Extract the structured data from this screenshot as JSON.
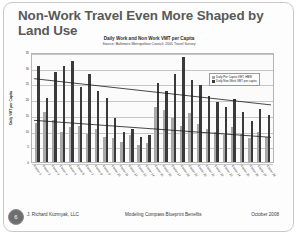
{
  "slide": {
    "title": "Non-Work Travel Even More Shaped by Land Use",
    "page_number": "6"
  },
  "footer": {
    "left": "J. Richard Kuzmyak, LLC",
    "center": "Modeling Compass Blueprint Benefits",
    "right": "October 2008"
  },
  "chart_data": {
    "type": "bar",
    "title": "Daily Work and Non Work VMT per Capita",
    "subtitle": "Source:  Baltimore Metropolitan Council, 2001 Travel Survey",
    "xlabel": "",
    "ylabel": "Daily VMT per Capita",
    "ylim": [
      0,
      35
    ],
    "yticks": [
      0,
      5,
      10,
      15,
      20,
      25,
      30,
      35
    ],
    "grid": true,
    "legend_position": "top-right",
    "categories": [
      "Cluster 1",
      "Cluster 2",
      "Cluster 3",
      "Cluster 4",
      "Cluster 5",
      "Cluster 6",
      "Cluster 7",
      "Cluster 8",
      "Cluster 9",
      "Cluster 10",
      "Cluster 11",
      "Cluster 12",
      "Cluster 13",
      "Cluster 14",
      "Cluster 15",
      "Cluster 16",
      "Cluster 17",
      "Cluster 18",
      "Cluster 19",
      "Cluster 20",
      "Cluster 21",
      "Cluster 22",
      "Cluster 23",
      "Cluster 24",
      "Cluster 25",
      "Cluster 26",
      "Cluster 27",
      "Cluster 28"
    ],
    "series": [
      {
        "name": "Daily Per Capita VMT, HBW",
        "color": "#a8a8a8",
        "values": [
          12.5,
          16.0,
          13.5,
          9.5,
          11.0,
          11.5,
          9.0,
          10.5,
          8.0,
          7.5,
          6.5,
          8.5,
          5.5,
          6.0,
          17.5,
          16.5,
          14.0,
          11.5,
          15.5,
          12.0,
          10.5,
          9.5,
          8.5,
          11.0,
          9.0,
          7.5,
          9.5,
          8.0
        ]
      },
      {
        "name": "Daily Non Work VMT per capita",
        "color": "#3a3a3a",
        "values": [
          30.5,
          20.5,
          28.5,
          30.5,
          32.0,
          24.0,
          28.0,
          22.5,
          20.5,
          14.0,
          9.5,
          10.5,
          8.0,
          8.5,
          25.0,
          22.5,
          28.0,
          33.5,
          26.0,
          24.5,
          21.0,
          19.0,
          17.5,
          20.0,
          16.0,
          13.0,
          17.0,
          15.0
        ]
      }
    ],
    "trendlines": [
      {
        "name": "Non-work trend",
        "start_y": 27.0,
        "end_y": 18.5
      },
      {
        "name": "Work trend",
        "start_y": 13.5,
        "end_y": 8.0
      }
    ]
  }
}
